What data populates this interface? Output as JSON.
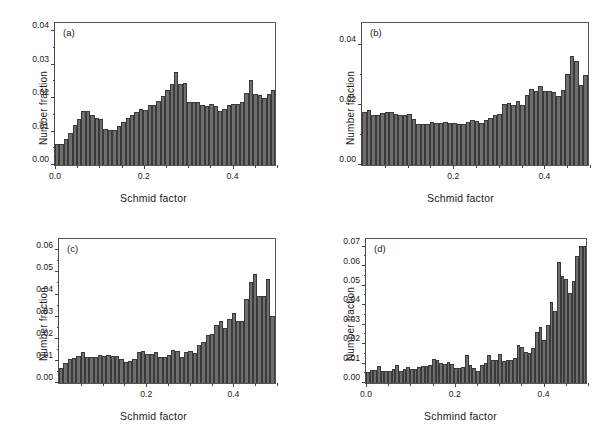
{
  "figure": {
    "background": "#ffffff",
    "bar_color": "#6e6e6e",
    "bar_edge_color": "#3a3a3a",
    "axis_color": "#444444"
  },
  "chart_data": [
    {
      "type": "bar",
      "panel": "(a)",
      "title": "",
      "xlabel": "Schmid factor",
      "ylabel": "Number fraction",
      "xlim": [
        0.0,
        0.5
      ],
      "ylim": [
        0.0,
        0.043
      ],
      "grid": false,
      "legend": null,
      "xticks": [
        0.0,
        0.2,
        0.4
      ],
      "xtick_labels": [
        "0.0",
        "0.2",
        "0.4"
      ],
      "xticks_minor": [
        0.05,
        0.1,
        0.15,
        0.25,
        0.3,
        0.35,
        0.45,
        0.5
      ],
      "yticks": [
        0.0,
        0.01,
        0.02,
        0.03,
        0.04
      ],
      "ytick_labels": [
        "0.00",
        "0.01",
        "0.02",
        "0.03",
        "0.04"
      ],
      "yticks_minor": [
        0.005,
        0.015,
        0.025,
        0.035
      ],
      "bin_width": 0.01,
      "x": [
        0.005,
        0.015,
        0.025,
        0.035,
        0.045,
        0.055,
        0.065,
        0.075,
        0.085,
        0.095,
        0.105,
        0.115,
        0.125,
        0.135,
        0.145,
        0.155,
        0.165,
        0.175,
        0.185,
        0.195,
        0.205,
        0.215,
        0.225,
        0.235,
        0.245,
        0.255,
        0.265,
        0.275,
        0.285,
        0.295,
        0.305,
        0.315,
        0.325,
        0.335,
        0.345,
        0.355,
        0.365,
        0.375,
        0.385,
        0.395,
        0.405,
        0.415,
        0.425,
        0.435,
        0.445,
        0.455,
        0.465,
        0.475,
        0.485,
        0.495
      ],
      "values": [
        0.0063,
        0.0063,
        0.0078,
        0.0098,
        0.0122,
        0.014,
        0.0165,
        0.0163,
        0.0152,
        0.0142,
        0.014,
        0.0108,
        0.0105,
        0.0107,
        0.0118,
        0.013,
        0.0142,
        0.0152,
        0.016,
        0.017,
        0.0168,
        0.0182,
        0.0182,
        0.0195,
        0.0208,
        0.0228,
        0.0245,
        0.0282,
        0.0245,
        0.0248,
        0.0192,
        0.0192,
        0.019,
        0.0182,
        0.0178,
        0.0184,
        0.018,
        0.0165,
        0.017,
        0.0182,
        0.0186,
        0.0185,
        0.019,
        0.0218,
        0.0258,
        0.0215,
        0.0212,
        0.0204,
        0.0215,
        0.0228
      ]
    },
    {
      "type": "bar",
      "panel": "(b)",
      "title": "",
      "xlabel": "Schmid factor",
      "ylabel": "Number fraction",
      "xlim": [
        0.0,
        0.5
      ],
      "ylim": [
        0.0,
        0.048
      ],
      "grid": false,
      "legend": null,
      "xticks": [
        0.2,
        0.4
      ],
      "xtick_labels": [
        "0.2",
        "0.4"
      ],
      "xticks_minor": [
        0.05,
        0.1,
        0.15,
        0.25,
        0.3,
        0.35,
        0.45,
        0.5
      ],
      "yticks": [
        0.0,
        0.02,
        0.04
      ],
      "ytick_labels": [
        "0.00",
        "0.02",
        "0.04"
      ],
      "yticks_minor": [
        0.01,
        0.03
      ],
      "bin_width": 0.01,
      "x": [
        0.005,
        0.015,
        0.025,
        0.035,
        0.045,
        0.055,
        0.065,
        0.075,
        0.085,
        0.095,
        0.105,
        0.115,
        0.125,
        0.135,
        0.145,
        0.155,
        0.165,
        0.175,
        0.185,
        0.195,
        0.205,
        0.215,
        0.225,
        0.235,
        0.245,
        0.255,
        0.265,
        0.275,
        0.285,
        0.295,
        0.305,
        0.315,
        0.325,
        0.335,
        0.345,
        0.355,
        0.365,
        0.375,
        0.385,
        0.395,
        0.405,
        0.415,
        0.425,
        0.435,
        0.445,
        0.455,
        0.465,
        0.475,
        0.485,
        0.495
      ],
      "values": [
        0.0178,
        0.0186,
        0.0168,
        0.017,
        0.0176,
        0.0178,
        0.018,
        0.0172,
        0.017,
        0.0168,
        0.0172,
        0.0156,
        0.0137,
        0.0138,
        0.0138,
        0.0146,
        0.0143,
        0.0143,
        0.0146,
        0.0143,
        0.0143,
        0.014,
        0.0138,
        0.0147,
        0.0152,
        0.0149,
        0.0143,
        0.0152,
        0.0158,
        0.0168,
        0.0173,
        0.0206,
        0.0208,
        0.0204,
        0.0216,
        0.0203,
        0.0235,
        0.0258,
        0.025,
        0.0268,
        0.025,
        0.025,
        0.0248,
        0.0233,
        0.0254,
        0.0306,
        0.0368,
        0.035,
        0.0272,
        0.0305
      ]
    },
    {
      "type": "bar",
      "panel": "(c)",
      "title": "",
      "xlabel": "Schmid factor",
      "ylabel": "Number fraction",
      "xlim": [
        0.0,
        0.5
      ],
      "ylim": [
        0.0,
        0.066
      ],
      "grid": false,
      "legend": null,
      "xticks": [
        0.2,
        0.4
      ],
      "xtick_labels": [
        "0.2",
        "0.4"
      ],
      "xticks_minor": [
        0.05,
        0.1,
        0.15,
        0.25,
        0.3,
        0.35,
        0.45,
        0.5
      ],
      "yticks": [
        0.0,
        0.01,
        0.02,
        0.03,
        0.04,
        0.05,
        0.06
      ],
      "ytick_labels": [
        "0.00",
        "0.01",
        "0.02",
        "0.03",
        "0.04",
        "0.05",
        "0.06"
      ],
      "yticks_minor": [
        0.005,
        0.015,
        0.025,
        0.035,
        0.045,
        0.055
      ],
      "bin_width": 0.01,
      "x": [
        0.005,
        0.015,
        0.025,
        0.035,
        0.045,
        0.055,
        0.065,
        0.075,
        0.085,
        0.095,
        0.105,
        0.115,
        0.125,
        0.135,
        0.145,
        0.155,
        0.165,
        0.175,
        0.185,
        0.195,
        0.205,
        0.215,
        0.225,
        0.235,
        0.245,
        0.255,
        0.265,
        0.275,
        0.285,
        0.295,
        0.305,
        0.315,
        0.325,
        0.335,
        0.345,
        0.355,
        0.365,
        0.375,
        0.385,
        0.395,
        0.405,
        0.415,
        0.425,
        0.435,
        0.445,
        0.455,
        0.465,
        0.475,
        0.485,
        0.495
      ],
      "values": [
        0.007,
        0.0092,
        0.011,
        0.0113,
        0.0122,
        0.0142,
        0.0118,
        0.0118,
        0.012,
        0.0128,
        0.0122,
        0.013,
        0.0125,
        0.0122,
        0.0112,
        0.0098,
        0.01,
        0.0112,
        0.0144,
        0.0148,
        0.0132,
        0.0134,
        0.014,
        0.012,
        0.0118,
        0.0128,
        0.0152,
        0.0146,
        0.0118,
        0.014,
        0.0148,
        0.0136,
        0.0174,
        0.0186,
        0.0222,
        0.0226,
        0.0268,
        0.0283,
        0.0252,
        0.0292,
        0.032,
        0.0284,
        0.0286,
        0.0385,
        0.0463,
        0.05,
        0.04,
        0.04,
        0.0475,
        0.0305
      ]
    },
    {
      "type": "bar",
      "panel": "(d)",
      "title": "",
      "xlabel": "Schmind factor",
      "ylabel": "Number fraction",
      "xlim": [
        0.0,
        0.5
      ],
      "ylim": [
        0.0,
        0.075
      ],
      "grid": false,
      "legend": null,
      "xticks": [
        0.0,
        0.2,
        0.4
      ],
      "xtick_labels": [
        "0.0",
        "0.2",
        "0.4"
      ],
      "xticks_minor": [
        0.05,
        0.1,
        0.15,
        0.25,
        0.3,
        0.35,
        0.45,
        0.5
      ],
      "yticks": [
        0.0,
        0.01,
        0.02,
        0.03,
        0.04,
        0.05,
        0.06,
        0.07
      ],
      "ytick_labels": [
        "0.00",
        "0.01",
        "0.02",
        "0.03",
        "0.04",
        "0.05",
        "0.06",
        "0.07"
      ],
      "yticks_minor": [
        0.005,
        0.015,
        0.025,
        0.035,
        0.045,
        0.055,
        0.065
      ],
      "bin_width": 0.00833,
      "x": [
        0.004,
        0.012,
        0.021,
        0.029,
        0.037,
        0.046,
        0.054,
        0.062,
        0.071,
        0.079,
        0.087,
        0.096,
        0.104,
        0.112,
        0.121,
        0.129,
        0.137,
        0.146,
        0.154,
        0.162,
        0.171,
        0.179,
        0.187,
        0.196,
        0.204,
        0.212,
        0.221,
        0.229,
        0.237,
        0.246,
        0.254,
        0.262,
        0.271,
        0.279,
        0.287,
        0.296,
        0.304,
        0.312,
        0.321,
        0.329,
        0.337,
        0.346,
        0.354,
        0.362,
        0.371,
        0.379,
        0.387,
        0.396,
        0.404,
        0.412,
        0.421,
        0.429,
        0.437,
        0.446,
        0.454,
        0.462,
        0.471,
        0.479,
        0.487,
        0.496
      ],
      "values": [
        0.0058,
        0.007,
        0.007,
        0.009,
        0.0065,
        0.0062,
        0.0062,
        0.0072,
        0.0096,
        0.006,
        0.0072,
        0.0086,
        0.0072,
        0.0075,
        0.0082,
        0.0088,
        0.009,
        0.0092,
        0.0124,
        0.0118,
        0.0102,
        0.0098,
        0.0112,
        0.01,
        0.0078,
        0.0076,
        0.0085,
        0.0144,
        0.0094,
        0.0078,
        0.0064,
        0.0092,
        0.0106,
        0.0144,
        0.0122,
        0.012,
        0.0152,
        0.0116,
        0.0118,
        0.012,
        0.0128,
        0.0196,
        0.0186,
        0.0163,
        0.0156,
        0.0182,
        0.0268,
        0.0292,
        0.0226,
        0.0304,
        0.042,
        0.0377,
        0.0632,
        0.0558,
        0.0543,
        0.047,
        0.053,
        0.066,
        0.0712,
        0.0712
      ]
    }
  ]
}
